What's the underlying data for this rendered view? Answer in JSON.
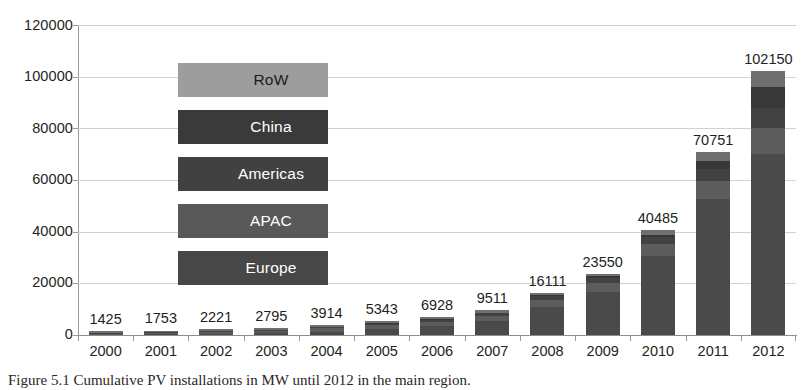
{
  "chart_data": {
    "type": "bar",
    "title": "",
    "subtitle": "",
    "xlabel": "",
    "ylabel": "",
    "ylim": [
      0,
      120000
    ],
    "yticks": [
      0,
      20000,
      40000,
      60000,
      80000,
      100000,
      120000
    ],
    "ytick_labels": [
      "0",
      "20000",
      "40000",
      "60000",
      "80000",
      "100000",
      "120000"
    ],
    "grid": true,
    "stacked": true,
    "legend_position": "inside-plot-left",
    "categories": [
      "2000",
      "2001",
      "2002",
      "2003",
      "2004",
      "2005",
      "2006",
      "2007",
      "2008",
      "2009",
      "2010",
      "2011",
      "2012"
    ],
    "totals": [
      1425,
      1753,
      2221,
      2795,
      3914,
      5343,
      6928,
      9511,
      16111,
      23550,
      40485,
      70751,
      102150
    ],
    "data_labels": [
      "1425",
      "1753",
      "2221",
      "2795",
      "3914",
      "5343",
      "6928",
      "9511",
      "16111",
      "23550",
      "40485",
      "70751",
      "102150"
    ],
    "series": [
      {
        "name": "Europe",
        "color": "#4a4a4a",
        "values": [
          160,
          260,
          400,
          600,
          1300,
          2300,
          3300,
          5300,
          11000,
          16800,
          30500,
          52800,
          70000
        ]
      },
      {
        "name": "APAC",
        "color": "#5c5c5c",
        "values": [
          400,
          500,
          700,
          950,
          1250,
          1550,
          1850,
          2150,
          2700,
          3300,
          4600,
          6800,
          10200
        ]
      },
      {
        "name": "Americas",
        "color": "#424242",
        "values": [
          200,
          250,
          300,
          350,
          450,
          550,
          700,
          900,
          1250,
          1800,
          2700,
          4500,
          7500
        ]
      },
      {
        "name": "China",
        "color": "#383838",
        "values": [
          20,
          30,
          40,
          60,
          90,
          130,
          200,
          300,
          450,
          800,
          1000,
          3300,
          8300
        ]
      },
      {
        "name": "RoW",
        "color": "#6f6f6f",
        "values": [
          645,
          713,
          781,
          835,
          824,
          813,
          878,
          861,
          711,
          850,
          1685,
          3351,
          6150
        ]
      }
    ]
  },
  "legend": {
    "items": [
      {
        "label": "RoW",
        "swatch": "#9d9d9d"
      },
      {
        "label": "China",
        "swatch": "#3a3a3a"
      },
      {
        "label": "Americas",
        "swatch": "#414141"
      },
      {
        "label": "APAC",
        "swatch": "#595959"
      },
      {
        "label": "Europe",
        "swatch": "#474747"
      }
    ]
  },
  "caption": {
    "text": "Figure 5.1  Cumulative PV installations in MW until 2012 in the main region."
  }
}
